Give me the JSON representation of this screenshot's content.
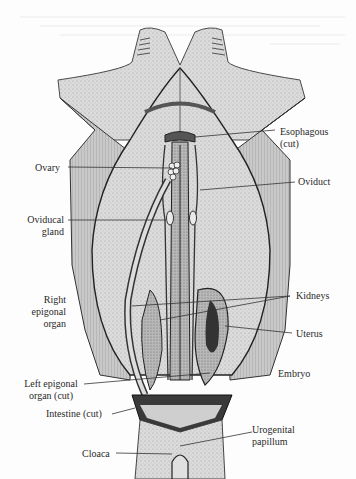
{
  "figure": {
    "colors": {
      "paper": "#fdfdfd",
      "ink": "#2a2a2a",
      "shade_light": "#d8d8d8",
      "shade_mid": "#a9a9a9",
      "shade_dark": "#4a4a4a"
    }
  },
  "labels": {
    "esophagous": {
      "line1": "Esophagous",
      "line2": "(cut)"
    },
    "ovary": "Ovary",
    "oviduct": "Oviduct",
    "oviducal_gland": {
      "line1": "Oviducal",
      "line2": "gland"
    },
    "right_epigonal": {
      "line1": "Right",
      "line2": "epigonal",
      "line3": "organ"
    },
    "kidneys": "Kidneys",
    "uterus": "Uterus",
    "embryo": "Embryo",
    "left_epigonal": {
      "line1": "Left epigonal",
      "line2": "organ (cut)"
    },
    "intestine": "Intestine (cut)",
    "urogenital": {
      "line1": "Urogenital",
      "line2": "papillum"
    },
    "cloaca": "Cloaca"
  }
}
